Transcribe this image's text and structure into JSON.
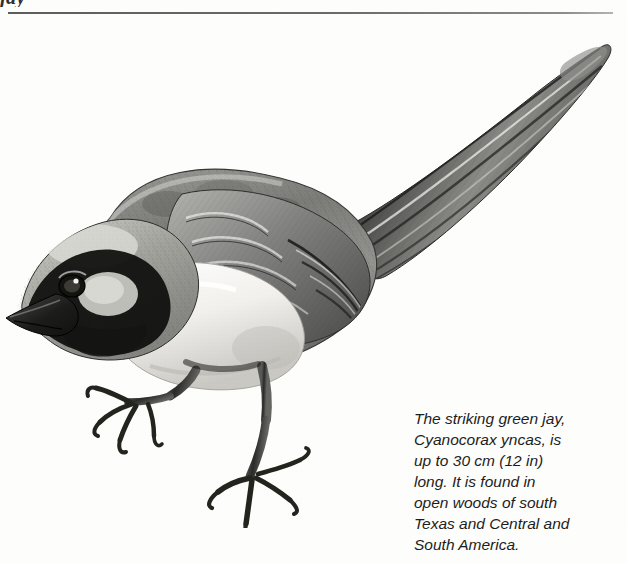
{
  "page": {
    "header_partial_text": "jay",
    "background_color": "#fdfdfc",
    "ink_color": "#1d1d1d",
    "rule_color": "#5d5d5d"
  },
  "illustration": {
    "subject": "green jay perched and leaning forward",
    "scientific_name": "Cyanocorax yncas",
    "medium": "black and white engraving / stipple drawing",
    "alt_text": "Detailed grayscale illustration of a green jay leaning forward on two legs with a long tail raised behind it",
    "parts": [
      "beak",
      "eye",
      "black-facial-mask",
      "pale-crown-patch",
      "nape",
      "back",
      "wing-coverts",
      "primary-feathers",
      "long-tail",
      "pale-breast",
      "belly",
      "left-leg",
      "right-leg",
      "toes-and-claws"
    ]
  },
  "caption": {
    "lines": [
      "The striking green jay,",
      "Cyanocorax yncas, is",
      "up to 30 cm (12 in)",
      "long. It is found in",
      "open woods of south",
      "Texas and Central and",
      "South America."
    ],
    "full_text": "The striking green jay, Cyanocorax yncas, is up to 30 cm (12 in) long. It is found in open woods of south Texas and Central and South America."
  }
}
